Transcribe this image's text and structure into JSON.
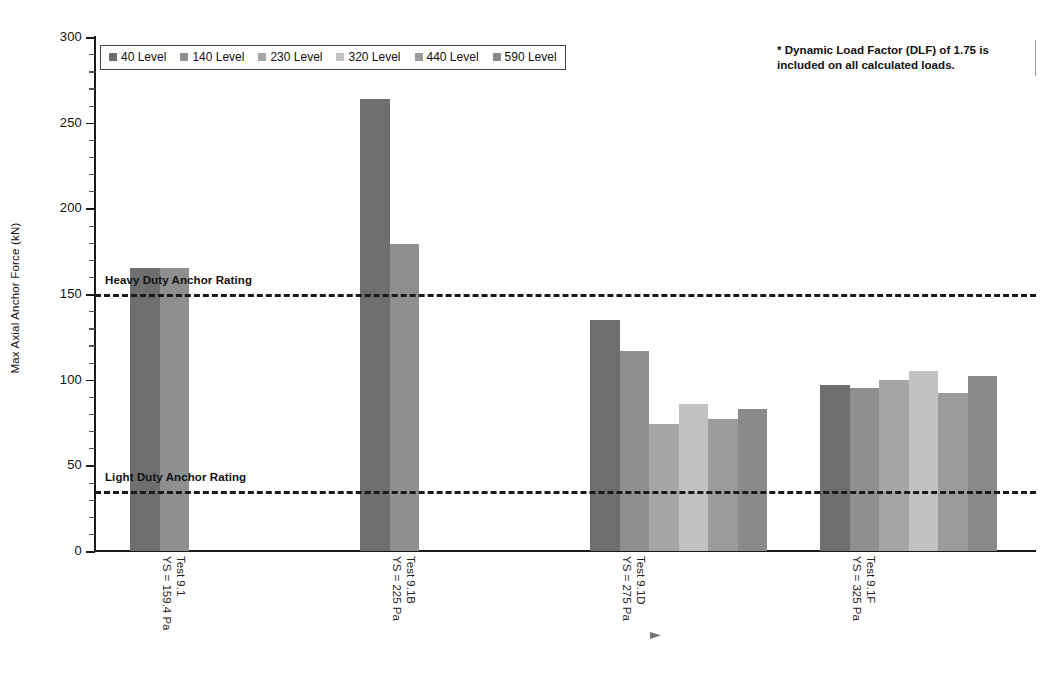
{
  "chart_data": {
    "type": "bar",
    "title": "",
    "xlabel": "",
    "ylabel": "Max Axial Anchor Force (kN)",
    "ylim": [
      0,
      300
    ],
    "ytick_step": 50,
    "yminor_step": 10,
    "ytick_labels": [
      "0",
      "50",
      "100",
      "150",
      "200",
      "250",
      "300"
    ],
    "grid": false,
    "legend_position": "top-left",
    "categories": [
      "Test 9.1\nYS = 159.4 Pa",
      "Test 9.1B\nYS = 225 Pa",
      "Test 9.1D\nYS = 275 Pa",
      "Test 9.1F\nYS = 325 Pa"
    ],
    "category_lines": [
      [
        "Test 9.1",
        "YS = 159.4 Pa"
      ],
      [
        "Test 9.1B",
        "YS = 225 Pa"
      ],
      [
        "Test 9.1D",
        "YS = 275 Pa"
      ],
      [
        "Test 9.1F",
        "YS = 325 Pa"
      ]
    ],
    "series": [
      {
        "name": "40 Level",
        "color": "#6e6e6e",
        "values": [
          165,
          264,
          135,
          97
        ]
      },
      {
        "name": "140 Level",
        "color": "#8f8f8f",
        "values": [
          165,
          179,
          117,
          95
        ]
      },
      {
        "name": "230 Level",
        "color": "#a6a6a6",
        "values": [
          null,
          null,
          74,
          100
        ]
      },
      {
        "name": "320 Level",
        "color": "#c2c2c2",
        "values": [
          null,
          null,
          86,
          105
        ]
      },
      {
        "name": "440 Level",
        "color": "#9b9b9b",
        "values": [
          null,
          null,
          77,
          92
        ]
      },
      {
        "name": "590 Level",
        "color": "#8a8a8a",
        "values": [
          null,
          null,
          83,
          102
        ]
      }
    ],
    "reference_lines": [
      {
        "label": "Heavy Duty Anchor Rating",
        "value": 150,
        "style": "dashed",
        "color": "#1a1a1a"
      },
      {
        "label": "Light Duty Anchor Rating",
        "value": 35,
        "style": "dashed",
        "color": "#1a1a1a"
      }
    ],
    "annotations": [
      {
        "name": "dlf-note",
        "lines": [
          "* Dynamic Load Factor (DLF) of 1.75 is",
          "included on all calculated loads."
        ]
      }
    ]
  }
}
